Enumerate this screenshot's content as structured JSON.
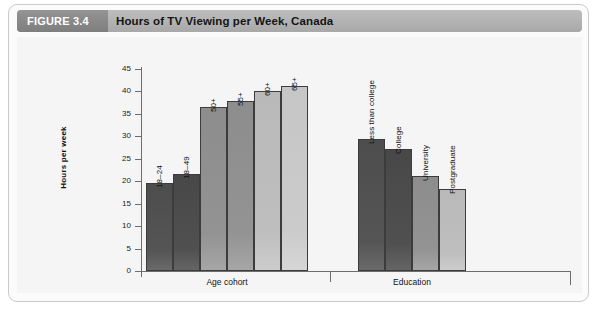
{
  "figure": {
    "tag": "FIGURE 3.4",
    "title": "Hours of TV Viewing per Week, Canada"
  },
  "chart_data": {
    "type": "bar",
    "title": "Hours of TV Viewing per Week, Canada",
    "xlabel": "",
    "ylabel": "Hours per week",
    "ylim": [
      0,
      45
    ],
    "yticks": [
      0,
      5,
      10,
      15,
      20,
      25,
      30,
      35,
      40,
      45
    ],
    "grid": false,
    "legend": false,
    "groups": [
      {
        "name": "Age cohort",
        "categories": [
          "18–24",
          "18–49",
          "50+",
          "55+",
          "60+",
          "65+"
        ],
        "values": [
          19.7,
          21.5,
          36.5,
          37.8,
          40.2,
          41.3
        ],
        "tones": [
          "tone-dark",
          "tone-darker",
          "tone-mid",
          "tone-mid",
          "tone-light",
          "tone-lighter"
        ]
      },
      {
        "name": "Education",
        "categories": [
          "Less than college",
          "College",
          "University",
          "Postgraduate"
        ],
        "values": [
          29.3,
          27.2,
          21.2,
          18.3
        ],
        "tones": [
          "tone-dark",
          "tone-darker",
          "tone-mid",
          "tone-light"
        ]
      }
    ]
  }
}
